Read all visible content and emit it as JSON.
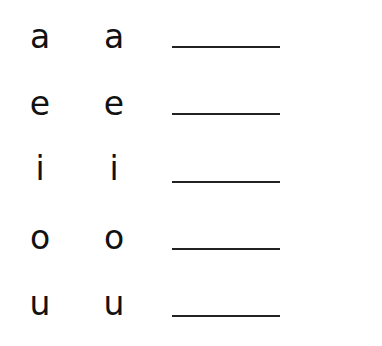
{
  "worksheet": {
    "rows": [
      {
        "letter_left": "a",
        "letter_right": "a",
        "answer": ""
      },
      {
        "letter_left": "e",
        "letter_right": "e",
        "answer": ""
      },
      {
        "letter_left": "i",
        "letter_right": "i",
        "answer": ""
      },
      {
        "letter_left": "o",
        "letter_right": "o",
        "answer": ""
      },
      {
        "letter_left": "u",
        "letter_right": "u",
        "answer": ""
      }
    ]
  }
}
